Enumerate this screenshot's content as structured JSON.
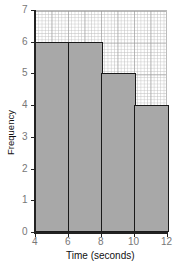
{
  "chart_data": {
    "type": "bar",
    "subtype": "histogram",
    "title": "",
    "xlabel": "Time (seconds)",
    "ylabel": "Frequency",
    "bins": [
      {
        "x_start": 4,
        "x_end": 6,
        "frequency": 6
      },
      {
        "x_start": 6,
        "x_end": 8,
        "frequency": 6
      },
      {
        "x_start": 8,
        "x_end": 10,
        "frequency": 5
      },
      {
        "x_start": 10,
        "x_end": 12,
        "frequency": 4
      }
    ],
    "categories": [
      "4-6",
      "6-8",
      "8-10",
      "10-12"
    ],
    "values": [
      6,
      6,
      5,
      4
    ],
    "xlim": [
      4,
      12
    ],
    "ylim": [
      0,
      7
    ],
    "x_ticks": [
      "4",
      "6",
      "8",
      "10",
      "12"
    ],
    "y_ticks": [
      "0",
      "1",
      "2",
      "3",
      "4",
      "5",
      "6",
      "7"
    ],
    "grid": true,
    "legend": null,
    "colors": {
      "bar_fill": "#a8a8a8",
      "bar_edge": "#1a1a1a",
      "grid": "#c4c4c4",
      "tick_label": "#777777"
    }
  }
}
